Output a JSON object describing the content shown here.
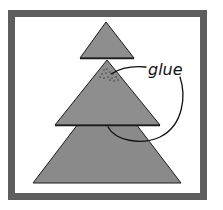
{
  "figure": {
    "annotation": "glue",
    "colors": {
      "frame": "#5e5e5e",
      "background": "#ffffff",
      "triangle_fill": "#8a8a8a",
      "outline": "#1a1a1a",
      "glue_dots": "#2a2a2a"
    },
    "pieces": [
      {
        "name": "top-triangle",
        "apex": [
          106,
          22
        ],
        "base_left": [
          80,
          58
        ],
        "base_right": [
          134,
          58
        ]
      },
      {
        "name": "middle-triangle",
        "apex": [
          107,
          60
        ],
        "base_left": [
          55,
          125
        ],
        "base_right": [
          160,
          125
        ]
      },
      {
        "name": "bottom-triangle",
        "apex": [
          107,
          86
        ],
        "base_left": [
          33,
          183
        ],
        "base_right": [
          181,
          183
        ]
      }
    ]
  }
}
